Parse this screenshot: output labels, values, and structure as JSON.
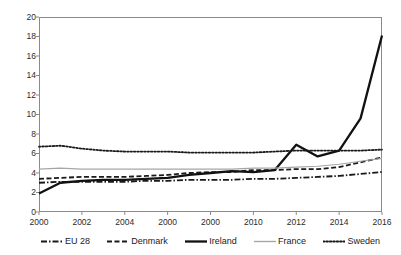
{
  "chart_data": {
    "type": "line",
    "title": "",
    "xlabel": "",
    "ylabel": "",
    "xlim": [
      2000,
      2016
    ],
    "ylim": [
      0,
      20
    ],
    "ytick_step": 2,
    "xtick_step": 2,
    "grid": false,
    "legend_position": "bottom",
    "x": [
      2000,
      2001,
      2002,
      2003,
      2004,
      2005,
      2006,
      2007,
      2008,
      2009,
      2010,
      2011,
      2012,
      2013,
      2014,
      2015,
      2016
    ],
    "ytick_labels": [
      "0",
      "2",
      "4",
      "6",
      "8",
      "10",
      "12",
      "14",
      "16",
      "18",
      "20"
    ],
    "xtick_labels": [
      "2000",
      "2002",
      "2004",
      "2000",
      "2000",
      "2010",
      "2012",
      "2014",
      "2016"
    ],
    "xtick_values": [
      2000,
      2002,
      2004,
      2006,
      2008,
      2010,
      2012,
      2014,
      2016
    ],
    "series": [
      {
        "name": "EU 28",
        "style": "dash-dot",
        "color": "#1a1a1a",
        "width": 1.8,
        "values": [
          3.0,
          3.1,
          3.1,
          3.1,
          3.1,
          3.2,
          3.2,
          3.3,
          3.3,
          3.3,
          3.4,
          3.4,
          3.5,
          3.6,
          3.7,
          3.9,
          4.1
        ]
      },
      {
        "name": "Denmark",
        "style": "dashed",
        "color": "#1a1a1a",
        "width": 1.8,
        "values": [
          3.4,
          3.5,
          3.6,
          3.6,
          3.6,
          3.7,
          3.8,
          4.0,
          4.1,
          4.1,
          4.3,
          4.3,
          4.4,
          4.4,
          4.6,
          5.1,
          5.6
        ]
      },
      {
        "name": "Ireland",
        "style": "solid",
        "color": "#111111",
        "width": 2.3,
        "values": [
          1.9,
          3.0,
          3.2,
          3.3,
          3.3,
          3.4,
          3.5,
          3.8,
          4.0,
          4.2,
          4.1,
          4.3,
          6.9,
          5.7,
          6.3,
          9.6,
          18.1
        ]
      },
      {
        "name": "France",
        "style": "solid-thin",
        "color": "#a6a6a6",
        "width": 1.1,
        "values": [
          4.4,
          4.5,
          4.4,
          4.4,
          4.4,
          4.4,
          4.4,
          4.4,
          4.4,
          4.4,
          4.5,
          4.5,
          4.6,
          4.7,
          4.9,
          5.2,
          5.5
        ]
      },
      {
        "name": "Sweden",
        "style": "dotted",
        "color": "#1a1a1a",
        "width": 1.8,
        "values": [
          6.7,
          6.8,
          6.5,
          6.3,
          6.2,
          6.2,
          6.2,
          6.1,
          6.1,
          6.1,
          6.1,
          6.2,
          6.3,
          6.3,
          6.3,
          6.3,
          6.4
        ]
      }
    ]
  }
}
